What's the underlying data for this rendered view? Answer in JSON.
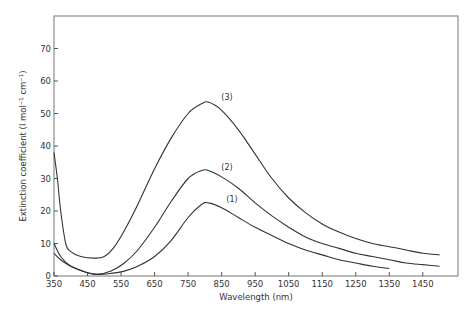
{
  "chart_data": {
    "type": "line",
    "title": "",
    "xlabel": "Wavelength (nm)",
    "ylabel": "Extinction coefficient (l mol⁻¹ cm⁻¹)",
    "xlim": [
      350,
      1555
    ],
    "ylim": [
      0,
      80
    ],
    "grid": false,
    "legend": "inline labels (1), (2), (3) above peaks",
    "x_ticks": [
      350,
      450,
      550,
      650,
      750,
      850,
      950,
      1050,
      1150,
      1250,
      1350,
      1450
    ],
    "y_ticks": [
      0,
      10,
      20,
      30,
      40,
      50,
      60,
      70
    ],
    "series": [
      {
        "name": "(1)",
        "points": [
          [
            350,
            10
          ],
          [
            370,
            6
          ],
          [
            400,
            3
          ],
          [
            450,
            1
          ],
          [
            480,
            0.5
          ],
          [
            520,
            0.8
          ],
          [
            560,
            1.5
          ],
          [
            600,
            3
          ],
          [
            650,
            6
          ],
          [
            700,
            11
          ],
          [
            750,
            18
          ],
          [
            790,
            22
          ],
          [
            810,
            22.5
          ],
          [
            850,
            21
          ],
          [
            900,
            18
          ],
          [
            950,
            15
          ],
          [
            1000,
            12.5
          ],
          [
            1050,
            10
          ],
          [
            1100,
            8
          ],
          [
            1150,
            6.5
          ],
          [
            1200,
            5
          ],
          [
            1250,
            4
          ],
          [
            1300,
            3
          ],
          [
            1350,
            2.3
          ]
        ]
      },
      {
        "name": "(2)",
        "points": [
          [
            350,
            7
          ],
          [
            370,
            5
          ],
          [
            400,
            3
          ],
          [
            450,
            1
          ],
          [
            480,
            0.5
          ],
          [
            520,
            1.5
          ],
          [
            560,
            4
          ],
          [
            600,
            8
          ],
          [
            650,
            15
          ],
          [
            700,
            23
          ],
          [
            750,
            30
          ],
          [
            790,
            32.5
          ],
          [
            810,
            32.5
          ],
          [
            850,
            30.5
          ],
          [
            900,
            27
          ],
          [
            950,
            22.5
          ],
          [
            1000,
            18.5
          ],
          [
            1050,
            15
          ],
          [
            1100,
            12
          ],
          [
            1150,
            10
          ],
          [
            1200,
            8.5
          ],
          [
            1250,
            7
          ],
          [
            1300,
            6
          ],
          [
            1350,
            5
          ],
          [
            1400,
            4
          ],
          [
            1450,
            3.5
          ],
          [
            1500,
            3
          ]
        ]
      },
      {
        "name": "(3)",
        "points": [
          [
            350,
            38
          ],
          [
            360,
            30
          ],
          [
            370,
            20
          ],
          [
            385,
            10
          ],
          [
            400,
            7.5
          ],
          [
            430,
            6
          ],
          [
            470,
            5.5
          ],
          [
            500,
            6
          ],
          [
            530,
            9
          ],
          [
            560,
            14
          ],
          [
            600,
            22
          ],
          [
            650,
            33
          ],
          [
            700,
            42.5
          ],
          [
            750,
            50
          ],
          [
            790,
            53
          ],
          [
            810,
            53.5
          ],
          [
            850,
            51
          ],
          [
            900,
            45
          ],
          [
            950,
            37.5
          ],
          [
            1000,
            30
          ],
          [
            1050,
            24
          ],
          [
            1100,
            19.5
          ],
          [
            1150,
            16
          ],
          [
            1200,
            13.5
          ],
          [
            1250,
            11.5
          ],
          [
            1300,
            10
          ],
          [
            1350,
            9
          ],
          [
            1400,
            8
          ],
          [
            1450,
            7
          ],
          [
            1500,
            6.5
          ]
        ]
      }
    ]
  },
  "labels": {
    "xlabel": "Wavelength (nm)",
    "ylabel": "Extinction coefficient (l mol⁻¹ cm⁻¹)",
    "curve1": "(1)",
    "curve2": "(2)",
    "curve3": "(3)"
  }
}
